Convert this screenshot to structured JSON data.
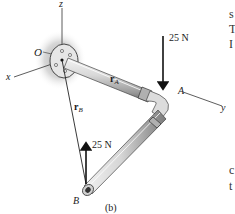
{
  "figure": {
    "caption": "(b)",
    "axes": {
      "x": "x",
      "y": "y",
      "z": "z",
      "origin": "O"
    },
    "points": {
      "A": "A",
      "B": "B"
    },
    "vectors": {
      "rA": {
        "symbol": "r",
        "subscript": "A"
      },
      "rB": {
        "symbol": "r",
        "subscript": "B"
      }
    },
    "forces": [
      {
        "label": "25 N",
        "at": "A",
        "direction": "down"
      },
      {
        "label": "25 N",
        "at": "B",
        "direction": "up"
      }
    ]
  },
  "edge_text": [
    "s",
    "T",
    "I",
    "c",
    "t"
  ]
}
